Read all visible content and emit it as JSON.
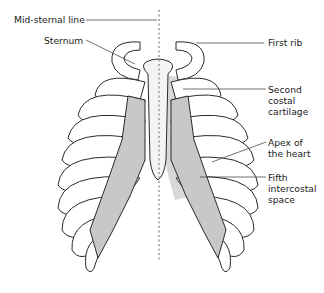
{
  "figure": {
    "type": "anatomical-diagram",
    "colors": {
      "bone_fill": "#ffffff",
      "outline": "#2b2b2b",
      "cartilage_shade": "#c8c8c8",
      "heart_shade": "#d4d4d4",
      "midline": "#8a8a8a"
    }
  },
  "labels": {
    "mid_sternal_line": "Mid-sternal line",
    "sternum": "Sternum",
    "first_rib": "First rib",
    "second_costal_cartilage": "Second\ncostal\ncartilage",
    "apex_of_heart": "Apex of\nthe heart",
    "fifth_intercostal_space": "Fifth\nintercostal\nspace"
  },
  "caption": {
    "text": ""
  }
}
